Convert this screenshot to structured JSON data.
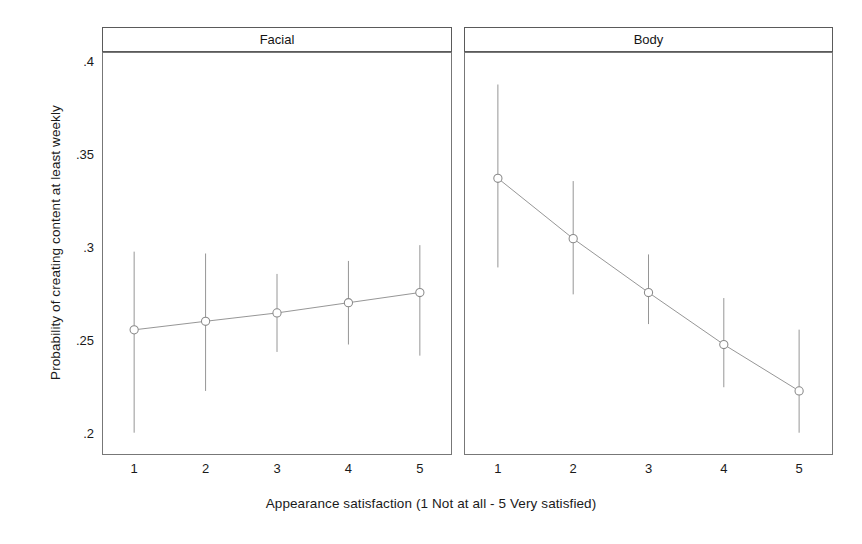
{
  "chart_data": {
    "type": "line",
    "title": "",
    "subtitle": "",
    "xlabel": "Appearance satisfaction (1 Not at all - 5 Very satisfied)",
    "ylabel": "Probability of creating content at least weekly",
    "x": [
      1,
      2,
      3,
      4,
      5
    ],
    "xtick_labels": [
      "1",
      "2",
      "3",
      "4",
      "5"
    ],
    "ytick_labels": [
      ".4",
      ".35",
      ".3",
      ".25",
      ".2"
    ],
    "ytick_values": [
      0.4,
      0.35,
      0.3,
      0.25,
      0.2
    ],
    "ylim": [
      0.188,
      0.405
    ],
    "xlim": [
      0.55,
      5.45
    ],
    "grid": false,
    "legend": "none",
    "error_bars": "95% confidence interval",
    "marker": "open-circle",
    "line_color": "#8a8a8a",
    "marker_color": "#8a8a8a",
    "errorbar_color": "#8a8a8a",
    "axis_color": "#777777",
    "panels": [
      {
        "label": "Facial",
        "categories": [
          "1",
          "2",
          "3",
          "4",
          "5"
        ],
        "values": [
          0.2554,
          0.26,
          0.2645,
          0.27,
          0.2755
        ],
        "ci_low": [
          0.2,
          0.2225,
          0.2435,
          0.2475,
          0.2415
        ],
        "ci_high": [
          0.2975,
          0.2965,
          0.2855,
          0.2925,
          0.301
        ]
      },
      {
        "label": "Body",
        "categories": [
          "1",
          "2",
          "3",
          "4",
          "5"
        ],
        "values": [
          0.337,
          0.3045,
          0.2755,
          0.2475,
          0.2225
        ],
        "ci_low": [
          0.289,
          0.2745,
          0.2585,
          0.2245,
          0.2
        ],
        "ci_high": [
          0.3875,
          0.3355,
          0.296,
          0.2725,
          0.2555
        ]
      }
    ]
  }
}
